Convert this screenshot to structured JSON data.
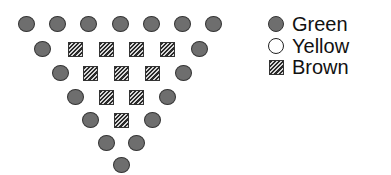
{
  "diagram": {
    "rows": [
      {
        "y": 24,
        "items": [
          {
            "x": 26,
            "type": "Green"
          },
          {
            "x": 57,
            "type": "Green"
          },
          {
            "x": 88,
            "type": "Green"
          },
          {
            "x": 120,
            "type": "Green"
          },
          {
            "x": 151,
            "type": "Green"
          },
          {
            "x": 182,
            "type": "Green"
          },
          {
            "x": 213,
            "type": "Green"
          }
        ]
      },
      {
        "y": 49,
        "items": [
          {
            "x": 42,
            "type": "Green"
          },
          {
            "x": 75,
            "type": "Brown"
          },
          {
            "x": 106,
            "type": "Brown"
          },
          {
            "x": 136,
            "type": "Brown"
          },
          {
            "x": 167,
            "type": "Brown"
          },
          {
            "x": 199,
            "type": "Green"
          }
        ]
      },
      {
        "y": 73,
        "items": [
          {
            "x": 60,
            "type": "Green"
          },
          {
            "x": 90,
            "type": "Brown"
          },
          {
            "x": 121,
            "type": "Brown"
          },
          {
            "x": 152,
            "type": "Brown"
          },
          {
            "x": 183,
            "type": "Green"
          }
        ]
      },
      {
        "y": 97,
        "items": [
          {
            "x": 75,
            "type": "Green"
          },
          {
            "x": 106,
            "type": "Brown"
          },
          {
            "x": 136,
            "type": "Brown"
          },
          {
            "x": 167,
            "type": "Green"
          }
        ]
      },
      {
        "y": 120,
        "items": [
          {
            "x": 90,
            "type": "Green"
          },
          {
            "x": 121,
            "type": "Brown"
          },
          {
            "x": 152,
            "type": "Green"
          }
        ]
      },
      {
        "y": 143,
        "items": [
          {
            "x": 106,
            "type": "Green"
          },
          {
            "x": 136,
            "type": "Green"
          }
        ]
      },
      {
        "y": 165,
        "items": [
          {
            "x": 121,
            "type": "Green"
          }
        ]
      }
    ]
  },
  "legend": {
    "items": [
      {
        "label": "Green",
        "marker": "filled-circle",
        "y": 13
      },
      {
        "label": "Yellow",
        "marker": "open-circle",
        "y": 35
      },
      {
        "label": "Brown",
        "marker": "hatched-square",
        "y": 56
      }
    ]
  }
}
